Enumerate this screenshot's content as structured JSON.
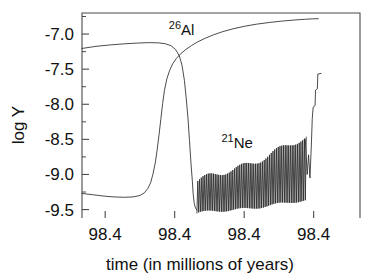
{
  "chart_data": {
    "type": "line",
    "title": "",
    "xlabel": "time (in millions of years)",
    "ylabel": "log Y",
    "xlim": [
      98.4395,
      98.4455
    ],
    "ylim": [
      -9.62,
      -6.7
    ],
    "grid": false,
    "legend_position": "inline-annotations",
    "x_tick_labels": [
      "98.4",
      "98.4",
      "98.4",
      "98.4"
    ],
    "x_tick_values": [
      98.44,
      98.4415,
      98.443,
      98.4445
    ],
    "y_tick_labels": [
      "-7.0",
      "-7.5",
      "-8.0",
      "-8.5",
      "-9.0",
      "-9.5"
    ],
    "y_tick_values": [
      -7.0,
      -7.5,
      -8.0,
      -8.5,
      -9.0,
      -9.5
    ],
    "y_minor_tick_values": [
      -6.75,
      -7.25,
      -7.75,
      -8.25,
      -8.75,
      -9.25
    ],
    "annotations": [
      {
        "name": "al26-label",
        "isotope_mass": "26",
        "element": "Al",
        "text": "26Al",
        "x": 98.44165,
        "y": -7.02
      },
      {
        "name": "ne21-label",
        "isotope_mass": "21",
        "element": "Ne",
        "text": "21Ne",
        "x": 98.44285,
        "y": -8.62
      }
    ],
    "series": [
      {
        "name": "26Al",
        "color": "#2b2b2b",
        "description": "Starts near -7.2, slight rise to plateau -7.12, steep drop through -8.85 crossing, then monotonic rise flattening at -6.78",
        "points": [
          [
            98.4395,
            -9.27
          ],
          [
            98.43975,
            -9.29
          ],
          [
            98.44,
            -9.31
          ],
          [
            98.4402,
            -9.32
          ],
          [
            98.4404,
            -9.325
          ],
          [
            98.4406,
            -9.32
          ],
          [
            98.44075,
            -9.3
          ],
          [
            98.44085,
            -9.26
          ],
          [
            98.44092,
            -9.2
          ],
          [
            98.44098,
            -9.12
          ],
          [
            98.44103,
            -9.0
          ],
          [
            98.44108,
            -8.84
          ],
          [
            98.44112,
            -8.66
          ],
          [
            98.44116,
            -8.45
          ],
          [
            98.4412,
            -8.22
          ],
          [
            98.44124,
            -7.99
          ],
          [
            98.44128,
            -7.8
          ],
          [
            98.44133,
            -7.64
          ],
          [
            98.44139,
            -7.52
          ],
          [
            98.44146,
            -7.42
          ],
          [
            98.44154,
            -7.345
          ],
          [
            98.44163,
            -7.28
          ],
          [
            98.44174,
            -7.22
          ],
          [
            98.44186,
            -7.165
          ],
          [
            98.442,
            -7.11
          ],
          [
            98.44216,
            -7.06
          ],
          [
            98.44234,
            -7.01
          ],
          [
            98.44254,
            -6.965
          ],
          [
            98.44276,
            -6.925
          ],
          [
            98.443,
            -6.89
          ],
          [
            98.44326,
            -6.86
          ],
          [
            98.44354,
            -6.835
          ],
          [
            98.44382,
            -6.815
          ],
          [
            98.44408,
            -6.8
          ],
          [
            98.4443,
            -6.79
          ],
          [
            98.44448,
            -6.783
          ],
          [
            98.4446,
            -6.781
          ]
        ]
      },
      {
        "name": "26Al-upper-branch",
        "color": "#2b2b2b",
        "description": "Upper left branch: near -7.2 plateau then steep fall to the oscillation floor",
        "points": [
          [
            98.4395,
            -7.205
          ],
          [
            98.4398,
            -7.175
          ],
          [
            98.4401,
            -7.155
          ],
          [
            98.4404,
            -7.14
          ],
          [
            98.4407,
            -7.128
          ],
          [
            98.44095,
            -7.122
          ],
          [
            98.44115,
            -7.125
          ],
          [
            98.4413,
            -7.138
          ],
          [
            98.44142,
            -7.165
          ],
          [
            98.44152,
            -7.22
          ],
          [
            98.4416,
            -7.31
          ],
          [
            98.44166,
            -7.45
          ],
          [
            98.44171,
            -7.66
          ],
          [
            98.44175,
            -7.92
          ],
          [
            98.44179,
            -8.22
          ],
          [
            98.44182,
            -8.52
          ],
          [
            98.44185,
            -8.82
          ],
          [
            98.44188,
            -9.08
          ],
          [
            98.4419,
            -9.28
          ],
          [
            98.44192,
            -9.4
          ],
          [
            98.44194,
            -9.46
          ],
          [
            98.44196,
            -9.49
          ],
          [
            98.44198,
            -9.505
          ]
        ]
      },
      {
        "name": "21Ne",
        "color": "#2b2b2b",
        "description": "High-frequency oscillation, ~62 cycles, floor near -9.55 rising to -9.35, peaks rising from -9.1 to -8.5, then sharp staircase rise to -7.56 at the right edge",
        "oscillation": {
          "start_x": 98.44198,
          "end_x": 98.44432,
          "cycles": 62,
          "peak_start": -9.12,
          "peak_end": -8.5,
          "trough_start": -9.56,
          "trough_end": -9.38
        },
        "tail_points": [
          [
            98.44432,
            -8.5
          ],
          [
            98.44436,
            -9.0
          ],
          [
            98.44439,
            -8.72
          ],
          [
            98.44442,
            -9.05
          ],
          [
            98.44445,
            -8.58
          ],
          [
            98.44447,
            -8.2
          ],
          [
            98.44449,
            -8.04
          ],
          [
            98.44453,
            -8.02
          ],
          [
            98.44454,
            -7.8
          ],
          [
            98.44458,
            -7.78
          ],
          [
            98.44459,
            -7.57
          ],
          [
            98.44466,
            -7.56
          ]
        ]
      }
    ]
  },
  "axes": {
    "y_axis_title": "log Y",
    "x_axis_title": "time (in millions of years)"
  }
}
